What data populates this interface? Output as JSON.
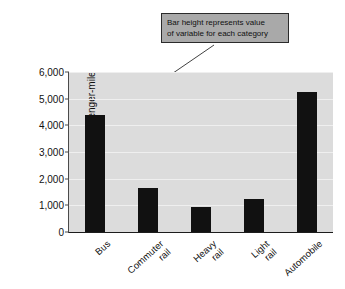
{
  "annotation": {
    "line1": "Bar height represents value",
    "line2": "of variable for each category"
  },
  "colors": {
    "bar": "#111111",
    "plot_background": "#dcdcdc",
    "gridline": "#efefef",
    "annotation_box": "#a9a9a9",
    "annotation_border": "#2b2b2b",
    "axis": "#1c1c1c",
    "text": "#111111"
  },
  "chart_data": {
    "type": "bar",
    "title": "",
    "xlabel": "",
    "ylabel": "BTU per passenger-mile",
    "categories": [
      "Bus",
      "Commuter rail",
      "Heavy rail",
      "Light rail",
      "Automobile"
    ],
    "category_lines": [
      [
        "Bus"
      ],
      [
        "Commuter",
        "rail"
      ],
      [
        "Heavy",
        "rail"
      ],
      [
        "Light",
        "rail"
      ],
      [
        "Automobile"
      ]
    ],
    "values": [
      4400,
      1650,
      950,
      1230,
      5250
    ],
    "ylim": [
      0,
      6000
    ],
    "yticks": [
      0,
      1000,
      2000,
      3000,
      4000,
      5000,
      6000
    ],
    "ytick_labels": [
      "0",
      "1,000",
      "2,000",
      "3,000",
      "4,000",
      "5,000",
      "6,000"
    ],
    "grid": true,
    "legend": false,
    "annotations": [
      {
        "text": "Bar height represents value of variable for each category",
        "points_to": "Bus"
      }
    ]
  }
}
